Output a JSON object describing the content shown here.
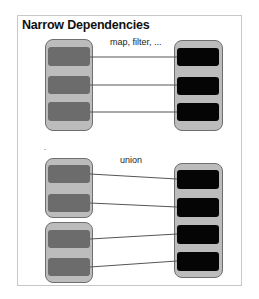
{
  "title": "Narrow Dependencies",
  "sections": [
    {
      "label": "map, filter, ..."
    },
    {
      "label": "union"
    }
  ],
  "colors": {
    "frame_border": "#c8c8c8",
    "outer_fill": "#bcbcbc",
    "outer_border": "#6f6f6f",
    "source_partition": "#6c6c6c",
    "target_partition": "#050505",
    "line": "#555555"
  }
}
